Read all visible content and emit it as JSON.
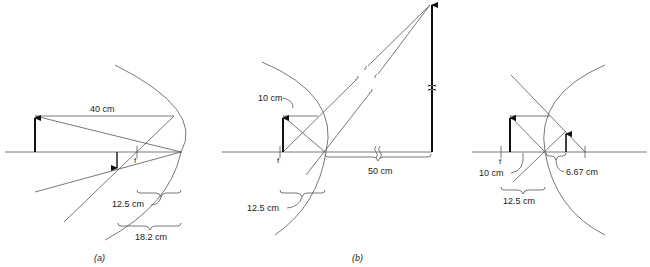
{
  "figure": {
    "colors": {
      "line": "#555555",
      "arrow": "#111111",
      "text": "#222222"
    }
  },
  "panels": [
    {
      "id": "a",
      "caption": "(a)",
      "mirror": "concave",
      "labels": {
        "object_distance": "40 cm",
        "focal_length": "12.5 cm",
        "image_distance": "18.2 cm",
        "focal_point": "f"
      }
    },
    {
      "id": "b",
      "caption": "(b)",
      "mirror": "concave",
      "labels": {
        "object_distance": "10 cm",
        "focal_length": "12.5 cm",
        "image_distance": "50 cm",
        "focal_point": "f"
      }
    },
    {
      "id": "c",
      "caption": "",
      "mirror": "convex",
      "labels": {
        "object_distance": "10 cm",
        "focal_length": "12.5 cm",
        "image_distance": "6.67 cm",
        "focal_point": "f"
      }
    }
  ]
}
